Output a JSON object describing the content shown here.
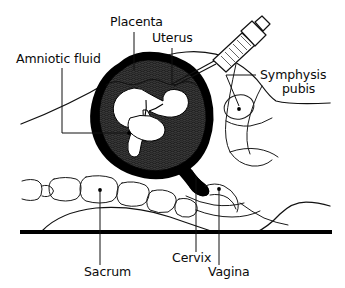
{
  "figure": {
    "type": "medical-anatomical-line-diagram",
    "canvas": {
      "width": 345,
      "height": 288,
      "background": "#ffffff"
    },
    "ink_color": "#111111",
    "fill_colors": {
      "uterine_wall": "#000000",
      "amniotic_fluid": "#3d3d3d",
      "fetus": "#ffffff",
      "table_line": "#000000"
    }
  },
  "labels": [
    {
      "id": "amniotic-fluid",
      "text": "Amniotic fluid",
      "text_x": 16,
      "text_y": 63,
      "anchor": "start",
      "lines": [
        "Amniotic fluid"
      ]
    },
    {
      "id": "placenta",
      "text": "Placenta",
      "text_x": 110,
      "text_y": 26,
      "anchor": "start",
      "lines": [
        "Placenta"
      ]
    },
    {
      "id": "uterus",
      "text": "Uterus",
      "text_x": 152,
      "text_y": 42,
      "anchor": "start",
      "lines": [
        "Uterus"
      ]
    },
    {
      "id": "symphysis-pubis",
      "text": "Symphysis pubis",
      "text_x": 260,
      "text_y": 79,
      "anchor": "start",
      "lines": [
        "Symphysis",
        "pubis"
      ]
    },
    {
      "id": "sacrum",
      "text": "Sacrum",
      "text_x": 84,
      "text_y": 276,
      "anchor": "start",
      "lines": [
        "Sacrum"
      ]
    },
    {
      "id": "cervix",
      "text": "Cervix",
      "text_x": 172,
      "text_y": 262,
      "anchor": "start",
      "lines": [
        "Cervix"
      ]
    },
    {
      "id": "vagina",
      "text": "Vagina",
      "text_x": 208,
      "text_y": 276,
      "anchor": "start",
      "lines": [
        "Vagina"
      ]
    }
  ],
  "structures": [
    {
      "id": "maternal-abdomen-contour",
      "name": "maternal abdominal wall"
    },
    {
      "id": "uterus-wall",
      "name": "uterine wall (black ring)"
    },
    {
      "id": "amniotic-cavity",
      "name": "amniotic fluid / placenta (stippled dark)"
    },
    {
      "id": "fetus",
      "name": "fetus in cephalic position (white silhouette)"
    },
    {
      "id": "cervix",
      "name": "cervix"
    },
    {
      "id": "vagina",
      "name": "vagina"
    },
    {
      "id": "symphysis-pubis",
      "name": "symphysis pubis (oval)"
    },
    {
      "id": "sacrum-vertebrae",
      "name": "sacral / lumbar vertebrae"
    },
    {
      "id": "syringe",
      "name": "amniocentesis syringe with needle"
    },
    {
      "id": "examination-table",
      "name": "examination table surface"
    }
  ]
}
